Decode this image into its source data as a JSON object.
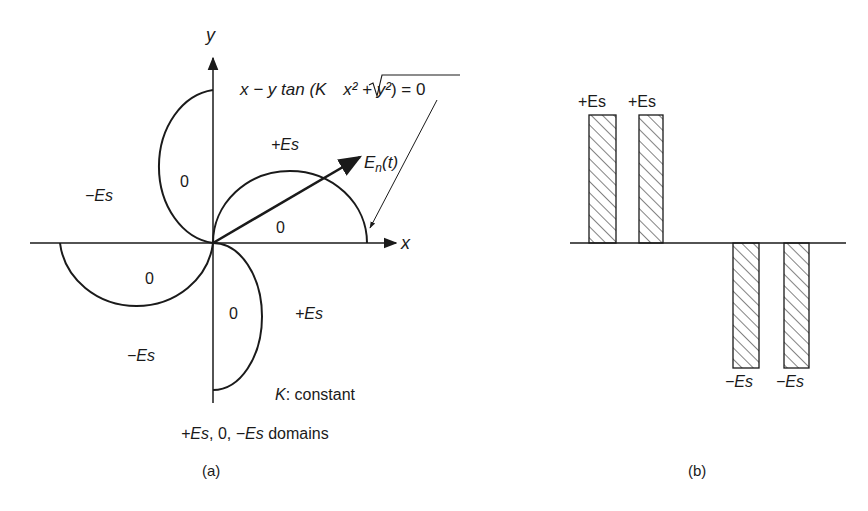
{
  "figure_a": {
    "axis_x_label": "x",
    "axis_y_label": "y",
    "equation": "x − y tan (K √x² + y²) = 0",
    "equation_parts": {
      "lhs": "x − y tan (K ",
      "radicand": "x² + y²",
      "rhs": ") = 0"
    },
    "vector_label": "E",
    "vector_subscript": "n",
    "vector_arg": "(t)",
    "regions": {
      "q1_outer": "+Es",
      "q1_inner": "0",
      "q2_outer": "−Es",
      "q2_inner": "0",
      "q3_inner": "0",
      "q3_outer": "−Es",
      "q4_inner": "0",
      "q4_outer": "+Es"
    },
    "note_k_symbol": "K",
    "note_k_text": ":  constant",
    "note_domains_pos": "+Es",
    "note_domains_zero": ", 0, ",
    "note_domains_neg": "−Es",
    "note_domains_suffix": " domains",
    "caption": "(a)"
  },
  "figure_b": {
    "bar_labels": [
      "+Es",
      "+Es",
      "−Es",
      "−Es"
    ],
    "caption": "(b)"
  },
  "colors": {
    "ink": "#1a1a1a",
    "background": "#ffffff"
  }
}
